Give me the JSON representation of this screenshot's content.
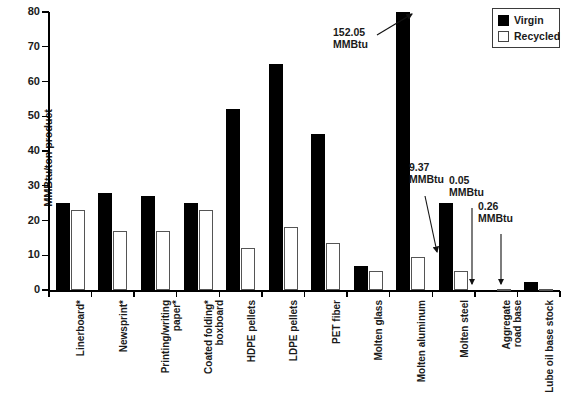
{
  "chart_data": {
    "type": "bar",
    "title": "",
    "xlabel": "",
    "ylabel": "MMBtu/ton product",
    "ylim": [
      0,
      80
    ],
    "yticks": [
      0,
      10,
      20,
      30,
      40,
      50,
      60,
      70,
      80
    ],
    "grid": false,
    "legend_position": "top-right",
    "categories": [
      "Linerboard*",
      "Newsprint*",
      "Printing/writing\npaper*",
      "Coated folding*\nboxboard",
      "HDPE pellets",
      "LDPE pellets",
      "PET fiber",
      "Molten glass",
      "Molten aluminum",
      "Molten steel",
      "Aggregate\nroad base",
      "Lube oil base stock"
    ],
    "series": [
      {
        "name": "Virgin",
        "color": "#000000",
        "values": [
          25.0,
          28.0,
          27.0,
          25.0,
          52.0,
          65.0,
          45.0,
          7.0,
          80.0,
          25.0,
          0.0,
          2.2
        ]
      },
      {
        "name": "Recycled",
        "color": "#ffffff",
        "values": [
          23.0,
          17.0,
          17.0,
          23.0,
          12.0,
          18.0,
          13.5,
          5.5,
          9.37,
          5.5,
          0.05,
          0.3
        ]
      }
    ],
    "annotations": [
      {
        "text": "152.05\nMMBtu",
        "value": 152.05,
        "unit": "MMBtu",
        "target_category": "Molten aluminum",
        "target_series": "Virgin"
      },
      {
        "text": "9.37\nMMBtu",
        "value": 9.37,
        "unit": "MMBtu",
        "target_category": "Molten aluminum",
        "target_series": "Recycled"
      },
      {
        "text": "0.05\nMMBtu",
        "value": 0.05,
        "unit": "MMBtu",
        "target_category": "Aggregate road base",
        "target_series": "Recycled"
      },
      {
        "text": "0.26\nMMBtu",
        "value": 0.26,
        "unit": "MMBtu",
        "target_category": "Lube oil base stock",
        "target_series": "Recycled"
      }
    ]
  },
  "legend": {
    "items": [
      {
        "label": "Virgin"
      },
      {
        "label": "Recycled"
      }
    ]
  },
  "axis": {
    "y_title": "MMBtu/ton product",
    "y_labels": [
      "80",
      "70",
      "60",
      "50",
      "40",
      "30",
      "20",
      "10",
      "0"
    ]
  }
}
